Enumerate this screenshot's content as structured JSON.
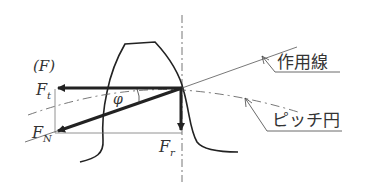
{
  "diagram": {
    "labels": {
      "resultant_group": "(F)",
      "tangential_force_main": "F",
      "tangential_force_sub": "t",
      "normal_force_main": "F",
      "normal_force_sub": "N",
      "radial_force_main": "F",
      "radial_force_sub": "r",
      "pressure_angle": "φ",
      "line_of_action": "作用線",
      "pitch_circle": "ピッチ円"
    },
    "colors": {
      "ink": "#333333",
      "thin": "#666666",
      "background": "#ffffff"
    }
  }
}
